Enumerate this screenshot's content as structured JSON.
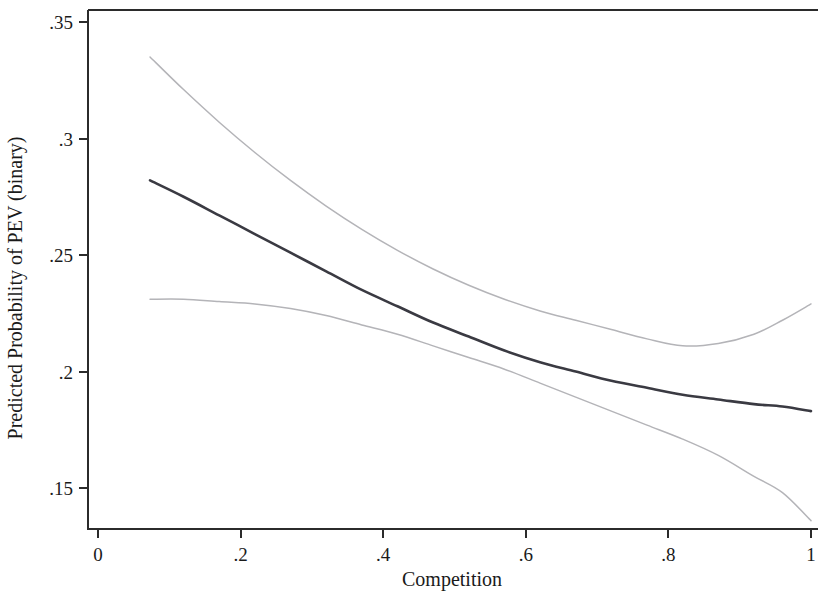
{
  "chart_data": {
    "type": "line",
    "title": "",
    "subtitle": "",
    "xlabel": "Competition",
    "ylabel": "Predicted Probability of PEV (binary)",
    "xlim": [
      0,
      1
    ],
    "ylim": [
      0.15,
      0.35
    ],
    "grid": false,
    "legend": null,
    "legend_position": "none",
    "xticks": [
      0,
      0.2,
      0.4,
      0.6,
      0.8,
      1
    ],
    "xticklabels": [
      "0",
      ".2",
      ".4",
      ".6",
      ".8",
      "1"
    ],
    "yticks": [
      0.15,
      0.2,
      0.25,
      0.3,
      0.35
    ],
    "yticklabels": [
      ".15",
      ".2",
      ".25",
      ".3",
      ".35"
    ],
    "x": [
      0.073,
      0.12,
      0.17,
      0.22,
      0.27,
      0.32,
      0.37,
      0.42,
      0.47,
      0.52,
      0.57,
      0.62,
      0.67,
      0.72,
      0.77,
      0.82,
      0.87,
      0.92,
      0.96,
      1.0
    ],
    "series": [
      {
        "name": "Upper 95% confidence bound",
        "role": "ci-upper",
        "color": "#b4b4b8",
        "values": [
          0.335,
          0.321,
          0.307,
          0.294,
          0.282,
          0.271,
          0.261,
          0.252,
          0.244,
          0.237,
          0.231,
          0.226,
          0.222,
          0.218,
          0.214,
          0.211,
          0.212,
          0.216,
          0.222,
          0.229
        ]
      },
      {
        "name": "Predicted probability",
        "role": "fit",
        "color": "#3a3a42",
        "values": [
          0.282,
          0.275,
          0.267,
          0.259,
          0.251,
          0.243,
          0.235,
          0.228,
          0.221,
          0.215,
          0.209,
          0.204,
          0.2,
          0.196,
          0.193,
          0.19,
          0.188,
          0.186,
          0.185,
          0.183
        ]
      },
      {
        "name": "Lower 95% confidence bound",
        "role": "ci-lower",
        "color": "#b4b4b8",
        "values": [
          0.231,
          0.231,
          0.23,
          0.229,
          0.227,
          0.224,
          0.22,
          0.216,
          0.211,
          0.206,
          0.201,
          0.195,
          0.189,
          0.183,
          0.177,
          0.171,
          0.164,
          0.155,
          0.148,
          0.136
        ]
      }
    ]
  }
}
